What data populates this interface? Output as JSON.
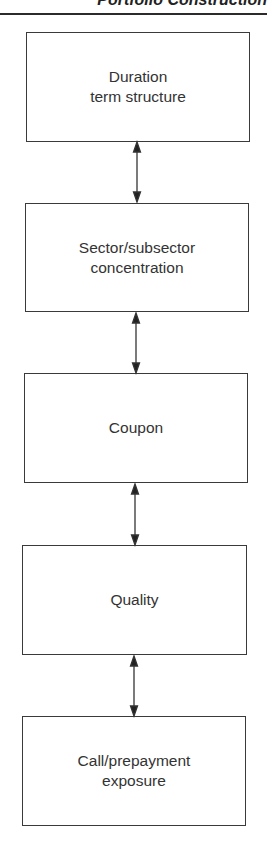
{
  "running_header": {
    "text": "Portfolio Construction"
  },
  "diagram": {
    "type": "vertical-flow",
    "connector": "bidirectional-arrow",
    "boxes": [
      {
        "label": "Duration\nterm structure"
      },
      {
        "label": "Sector/subsector\nconcentration"
      },
      {
        "label": "Coupon"
      },
      {
        "label": "Quality"
      },
      {
        "label": "Call/prepayment\nexposure"
      }
    ]
  },
  "colors": {
    "line": "#3a3a3a",
    "text": "#333333",
    "background": "#ffffff"
  }
}
